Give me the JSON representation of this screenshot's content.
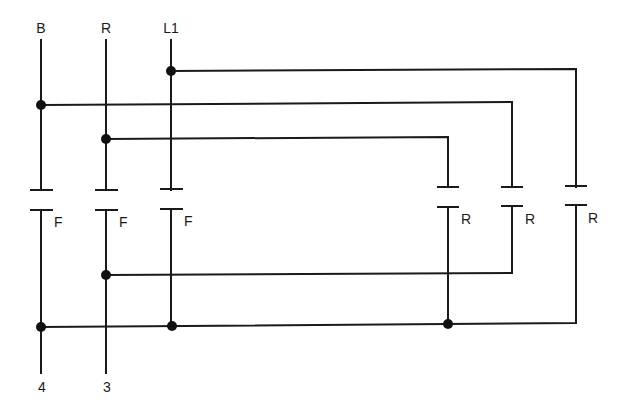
{
  "diagram": {
    "type": "ladder-contact-wiring",
    "colors": {
      "line": "#1a1a1a",
      "background": "#ffffff"
    },
    "top_terminals": [
      {
        "label": "B",
        "x": 41
      },
      {
        "label": "R",
        "x": 106
      },
      {
        "label": "L1",
        "x": 171
      }
    ],
    "bottom_terminals": [
      {
        "label": "4",
        "x": 41
      },
      {
        "label": "3",
        "x": 106
      }
    ],
    "contacts": [
      {
        "label": "F",
        "x": 41
      },
      {
        "label": "F",
        "x": 106
      },
      {
        "label": "F",
        "x": 171
      },
      {
        "label": "R",
        "x": 448
      },
      {
        "label": "R",
        "x": 512
      },
      {
        "label": "R",
        "x": 576
      }
    ]
  }
}
